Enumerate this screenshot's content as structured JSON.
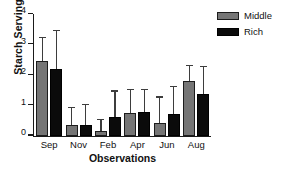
{
  "chart_data": {
    "type": "bar",
    "title": "",
    "xlabel": "Observations",
    "ylabel": "Starch Servings",
    "categories": [
      "Sep",
      "Nov",
      "Feb",
      "Apr",
      "Jun",
      "Aug"
    ],
    "ylim": [
      0,
      4
    ],
    "yticks": [
      0,
      1,
      2,
      3,
      4
    ],
    "ytick_labels": [
      "0",
      "1",
      "2",
      "3",
      "4"
    ],
    "grid": false,
    "legend_position": "top-right",
    "error_bars": "upper-only",
    "series": [
      {
        "name": "Middle",
        "color": "#757575",
        "values": [
          2.45,
          0.35,
          0.15,
          0.75,
          0.42,
          1.8
        ],
        "error_upper": [
          3.2,
          0.9,
          0.5,
          1.5,
          1.25,
          2.3
        ]
      },
      {
        "name": "Rich",
        "color": "#0b0b0b",
        "values": [
          2.18,
          0.34,
          0.6,
          0.77,
          0.7,
          1.37
        ],
        "error_upper": [
          3.45,
          1.0,
          1.45,
          1.5,
          1.6,
          2.25
        ]
      }
    ]
  },
  "legend": {
    "items": [
      {
        "label": "Middle"
      },
      {
        "label": "Rich"
      }
    ]
  }
}
